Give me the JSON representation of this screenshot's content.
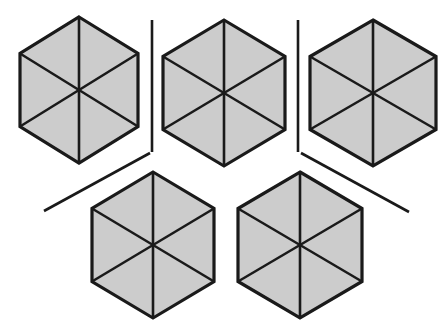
{
  "figure": {
    "canvas": {
      "width": 446,
      "height": 333
    },
    "background_color": "#ffffff",
    "shape_count": 5,
    "separator_count": 4
  },
  "style": {
    "fill_color": "#cccccc",
    "stroke_color": "#1a1a1a",
    "outline_width": 3.2,
    "spoke_width": 2.6,
    "separator_width": 2.6,
    "separator_color": "#1a1a1a"
  },
  "shapes": [
    {
      "name": "hexagon-1",
      "label": "Top-left hexagon",
      "orientation": "pointy-top",
      "center_x": 79,
      "center_y": 90,
      "half_width": 59,
      "half_height": 73,
      "triangle_count": 6,
      "fill": "#cccccc"
    },
    {
      "name": "hexagon-2",
      "label": "Top-center hexagon",
      "orientation": "pointy-top",
      "center_x": 224,
      "center_y": 93,
      "half_width": 61,
      "half_height": 73,
      "triangle_count": 6,
      "fill": "#cccccc"
    },
    {
      "name": "hexagon-3",
      "label": "Top-right hexagon",
      "orientation": "pointy-top",
      "center_x": 373,
      "center_y": 93,
      "half_width": 63,
      "half_height": 73,
      "triangle_count": 6,
      "fill": "#cccccc"
    },
    {
      "name": "hexagon-4",
      "label": "Bottom-left hexagon",
      "orientation": "pointy-top",
      "center_x": 153,
      "center_y": 245,
      "half_width": 61,
      "half_height": 73,
      "triangle_count": 6,
      "fill": "#cccccc"
    },
    {
      "name": "hexagon-5",
      "label": "Bottom-right hexagon",
      "orientation": "pointy-top",
      "center_x": 300,
      "center_y": 245,
      "half_width": 62,
      "half_height": 73,
      "triangle_count": 6,
      "fill": "#cccccc"
    }
  ],
  "separators": [
    {
      "name": "separator-vertical-left",
      "label": "Vertical divider between top-left and top-center hexagons",
      "x1": 152,
      "y1": 20,
      "x2": 152,
      "y2": 152
    },
    {
      "name": "separator-vertical-right",
      "label": "Vertical divider between top-center and top-right hexagons",
      "x1": 298,
      "y1": 20,
      "x2": 298,
      "y2": 152
    },
    {
      "name": "separator-diagonal-left",
      "label": "Diagonal divider descending to the lower left",
      "x1": 150,
      "y1": 153,
      "x2": 44,
      "y2": 211
    },
    {
      "name": "separator-diagonal-right",
      "label": "Diagonal divider descending to the lower right",
      "x1": 301,
      "y1": 153,
      "x2": 409,
      "y2": 212
    }
  ]
}
